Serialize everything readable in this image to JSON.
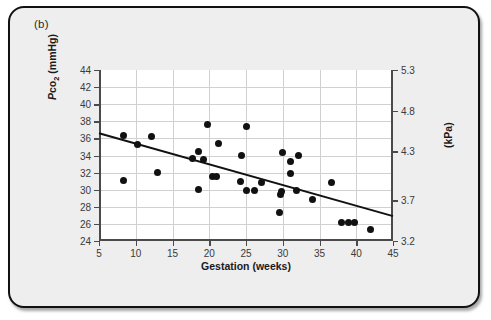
{
  "figure": {
    "panel_label": "(b)",
    "background_color": "#eeeeee",
    "border_color": "#111111"
  },
  "chart_data": {
    "type": "scatter",
    "title": "",
    "xlabel": "Gestation (weeks)",
    "ylabel": "Pco2 (mmHg)",
    "ylabel_html": "<i>P</i>co<sub>2</sub> (mmHg)",
    "ylabel_right": "(kPa)",
    "xlim": [
      5,
      45
    ],
    "ylim": [
      24,
      44
    ],
    "ylim_right": [
      3.2,
      5.3
    ],
    "grid": true,
    "legend": null,
    "xticks": [
      5,
      10,
      15,
      20,
      25,
      30,
      35,
      40,
      45
    ],
    "xticklabels": [
      "5",
      "10",
      "15",
      "20",
      "25",
      "30",
      "35",
      "40",
      "45"
    ],
    "yticks": [
      24,
      26,
      28,
      30,
      32,
      34,
      36,
      38,
      40,
      42,
      44
    ],
    "yticklabels": [
      "24",
      "26",
      "28",
      "30",
      "32",
      "34",
      "36",
      "38",
      "40",
      "42",
      "44"
    ],
    "yticks_right": [
      3.2,
      3.7,
      4.3,
      4.8,
      5.3
    ],
    "yticklabels_right": [
      "3.2",
      "3.7",
      "4.3",
      "4.8",
      "5.3"
    ],
    "marker_color": "#111111",
    "line_color": "#111111",
    "points": [
      {
        "x": 8.3,
        "y": 36.3
      },
      {
        "x": 8.3,
        "y": 31.1
      },
      {
        "x": 10.2,
        "y": 35.3
      },
      {
        "x": 12.2,
        "y": 36.2
      },
      {
        "x": 13.0,
        "y": 32.0
      },
      {
        "x": 17.7,
        "y": 33.6
      },
      {
        "x": 18.5,
        "y": 34.5
      },
      {
        "x": 18.6,
        "y": 30.0
      },
      {
        "x": 19.2,
        "y": 33.5
      },
      {
        "x": 19.7,
        "y": 37.6
      },
      {
        "x": 20.5,
        "y": 31.5
      },
      {
        "x": 21.0,
        "y": 31.5
      },
      {
        "x": 21.2,
        "y": 35.4
      },
      {
        "x": 24.2,
        "y": 31.0
      },
      {
        "x": 24.4,
        "y": 34.0
      },
      {
        "x": 25.0,
        "y": 37.4
      },
      {
        "x": 25.1,
        "y": 29.9
      },
      {
        "x": 26.1,
        "y": 29.9
      },
      {
        "x": 27.1,
        "y": 30.8
      },
      {
        "x": 29.6,
        "y": 27.3
      },
      {
        "x": 29.7,
        "y": 29.4
      },
      {
        "x": 29.8,
        "y": 29.8
      },
      {
        "x": 30.0,
        "y": 34.4
      },
      {
        "x": 31.0,
        "y": 31.9
      },
      {
        "x": 31.1,
        "y": 33.3
      },
      {
        "x": 31.9,
        "y": 29.9
      },
      {
        "x": 32.1,
        "y": 34.0
      },
      {
        "x": 34.0,
        "y": 28.9
      },
      {
        "x": 36.6,
        "y": 30.8
      },
      {
        "x": 38.0,
        "y": 26.2
      },
      {
        "x": 39.0,
        "y": 26.2
      },
      {
        "x": 39.8,
        "y": 26.2
      },
      {
        "x": 42.0,
        "y": 25.3
      }
    ],
    "fit_line": {
      "x_start": 5,
      "y_start": 36.6,
      "x_end": 45,
      "y_end": 26.9
    }
  }
}
